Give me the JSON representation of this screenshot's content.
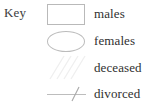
{
  "legend": {
    "title": "Key",
    "background_color": "#ffffff",
    "symbol_stroke_color": "#b9b9b9",
    "faint_stroke_color": "#ececec",
    "text_color": "#2f2f2f",
    "entries": [
      {
        "label": "males",
        "symbol": "rectangle-symbol",
        "symbol_description": "open rectangle outline"
      },
      {
        "label": "females",
        "symbol": "ellipse-symbol",
        "symbol_description": "open ellipse outline"
      },
      {
        "label": "deceased",
        "symbol": "diagonal-hatch-symbol",
        "symbol_description": "faint diagonal hatch lines"
      },
      {
        "label": "divorced",
        "symbol": "slashed-line-symbol",
        "symbol_description": "horizontal line crossed by a diagonal slash"
      }
    ]
  }
}
